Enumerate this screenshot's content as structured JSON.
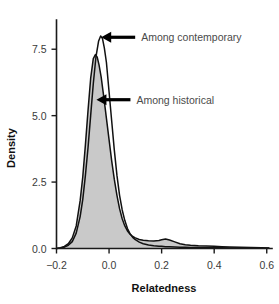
{
  "chart_data": {
    "type": "area",
    "title": "",
    "xlabel": "Relatedness",
    "ylabel": "Density",
    "xlim": [
      -0.2,
      0.62
    ],
    "ylim": [
      0.0,
      8.6
    ],
    "grid": false,
    "legend": "none",
    "xticks": [
      -0.2,
      0.0,
      0.2,
      0.4,
      0.6
    ],
    "xticklabels": [
      "−0.2",
      "0.0",
      "0.2",
      "0.4",
      "0.6"
    ],
    "yticks": [
      0.0,
      2.5,
      5.0,
      7.5
    ],
    "yticklabels": [
      "0.0",
      "2.5",
      "5.0",
      "7.5"
    ],
    "annotations": [
      {
        "text": "Among contemporary",
        "target_x": -0.03,
        "target_y": 7.95,
        "arrow": "left"
      },
      {
        "text": "Among historical",
        "target_x": -0.048,
        "target_y": 5.6,
        "arrow": "left"
      }
    ],
    "series": [
      {
        "name": "Among historical",
        "fill": "#c9c9c9",
        "line": "#111111",
        "x": [
          -0.2,
          -0.185,
          -0.17,
          -0.155,
          -0.14,
          -0.125,
          -0.11,
          -0.1,
          -0.09,
          -0.08,
          -0.07,
          -0.06,
          -0.052,
          -0.045,
          -0.038,
          -0.03,
          -0.02,
          -0.01,
          0.0,
          0.01,
          0.02,
          0.03,
          0.04,
          0.05,
          0.06,
          0.07,
          0.08,
          0.09,
          0.1,
          0.115,
          0.13,
          0.15,
          0.17,
          0.19,
          0.2,
          0.215,
          0.23,
          0.25,
          0.27,
          0.29,
          0.31,
          0.34,
          0.37,
          0.4,
          0.43,
          0.46,
          0.5,
          0.54,
          0.58,
          0.61
        ],
        "y": [
          0.0,
          0.03,
          0.08,
          0.18,
          0.4,
          0.85,
          1.8,
          2.7,
          3.9,
          5.2,
          6.4,
          7.15,
          7.3,
          7.2,
          6.9,
          6.45,
          5.7,
          4.9,
          4.1,
          3.3,
          2.6,
          2.0,
          1.5,
          1.12,
          0.85,
          0.66,
          0.54,
          0.45,
          0.4,
          0.34,
          0.31,
          0.29,
          0.28,
          0.3,
          0.33,
          0.36,
          0.32,
          0.25,
          0.18,
          0.14,
          0.12,
          0.1,
          0.09,
          0.08,
          0.07,
          0.06,
          0.05,
          0.04,
          0.03,
          0.02
        ]
      },
      {
        "name": "Among contemporary",
        "fill": "none",
        "line": "#111111",
        "x": [
          -0.2,
          -0.185,
          -0.17,
          -0.155,
          -0.14,
          -0.125,
          -0.11,
          -0.1,
          -0.09,
          -0.08,
          -0.07,
          -0.06,
          -0.05,
          -0.04,
          -0.032,
          -0.025,
          -0.018,
          -0.01,
          0.0,
          0.01,
          0.02,
          0.03,
          0.04,
          0.05,
          0.06,
          0.07,
          0.08,
          0.09,
          0.1,
          0.115,
          0.13,
          0.15,
          0.17,
          0.19,
          0.2,
          0.215,
          0.23,
          0.25,
          0.27,
          0.29,
          0.31,
          0.34,
          0.37,
          0.4,
          0.43,
          0.46,
          0.5,
          0.54,
          0.58,
          0.61
        ],
        "y": [
          0.0,
          0.02,
          0.05,
          0.12,
          0.26,
          0.58,
          1.2,
          1.85,
          2.75,
          3.8,
          5.0,
          6.2,
          7.2,
          7.8,
          8.0,
          7.9,
          7.55,
          7.0,
          5.9,
          4.8,
          3.7,
          2.75,
          2.0,
          1.45,
          1.05,
          0.75,
          0.55,
          0.42,
          0.33,
          0.24,
          0.18,
          0.13,
          0.1,
          0.08,
          0.08,
          0.07,
          0.07,
          0.06,
          0.05,
          0.05,
          0.04,
          0.04,
          0.03,
          0.03,
          0.03,
          0.02,
          0.02,
          0.02,
          0.01,
          0.01
        ]
      }
    ]
  }
}
